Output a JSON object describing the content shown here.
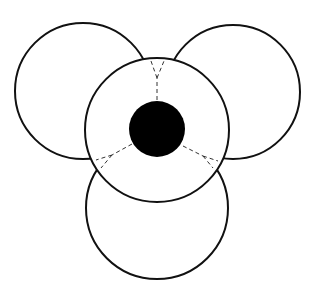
{
  "diagram": {
    "type": "overlapping-circles",
    "colors": {
      "stroke": "#111111",
      "background": "#ffffff",
      "core": "#000000",
      "dash": "#333333"
    },
    "outer_circles": [
      {
        "id": "top-left",
        "cx": 83,
        "cy": 91,
        "r": 68
      },
      {
        "id": "top-right",
        "cx": 233,
        "cy": 92,
        "r": 67
      },
      {
        "id": "bottom",
        "cx": 157,
        "cy": 208,
        "r": 71
      }
    ],
    "central_circle": {
      "cx": 157,
      "cy": 130,
      "r": 72
    },
    "core": {
      "cx": 157,
      "cy": 129,
      "r": 28
    },
    "dashed_connectors": [
      {
        "id": "top",
        "from": [
          157,
          101
        ],
        "to": [
          157,
          62
        ]
      },
      {
        "id": "lower-left",
        "from": [
          131,
          143
        ],
        "to": [
          94,
          164
        ]
      },
      {
        "id": "lower-right",
        "from": [
          184,
          145
        ],
        "to": [
          219,
          163
        ]
      }
    ]
  }
}
